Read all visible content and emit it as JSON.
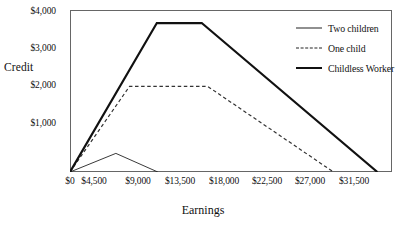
{
  "chart_data": {
    "type": "line",
    "title": "",
    "xlabel": "Earnings",
    "ylabel": "Credit",
    "xlim": [
      0,
      33000
    ],
    "ylim": [
      0,
      4350
    ],
    "grid": false,
    "legend_position": "top-right",
    "xticks": [
      "$0",
      "$4,500",
      "$9,000",
      "$13,500",
      "$18,000",
      "$22,500",
      "$27,000",
      "$31,500"
    ],
    "xtick_values": [
      0,
      4500,
      9000,
      13500,
      18000,
      22500,
      27000,
      31500
    ],
    "yticks": [
      "$1,000",
      "$2,000",
      "$3,000",
      "$4,000"
    ],
    "ytick_values": [
      1000,
      2000,
      3000,
      4000
    ],
    "series": [
      {
        "name": "Two children",
        "style": "thin-solid",
        "color": "#222222",
        "x": [
          0,
          4700,
          9000
        ],
        "y": [
          0,
          500,
          0
        ]
      },
      {
        "name": "One child",
        "style": "dashed",
        "color": "#333333",
        "x": [
          0,
          6100,
          14100,
          27000
        ],
        "y": [
          0,
          2300,
          2300,
          0
        ]
      },
      {
        "name": "Childless Worker",
        "style": "thick-solid",
        "color": "#111111",
        "x": [
          0,
          8900,
          13500,
          31500
        ],
        "y": [
          0,
          4000,
          4000,
          0
        ]
      }
    ]
  },
  "axes": {
    "y_title": "Credit",
    "x_title": "Earnings"
  },
  "legend": {
    "items": [
      {
        "label": "Two children",
        "swatch": "thin-solid-line-icon"
      },
      {
        "label": "One child",
        "swatch": "dashed-line-icon"
      },
      {
        "label": "Childless Worker",
        "swatch": "thick-solid-line-icon"
      }
    ]
  }
}
